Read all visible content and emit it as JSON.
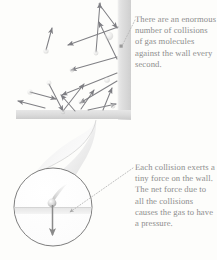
{
  "figure": {
    "background_color": "#fdfdfb",
    "text_color": "#8c8c8c",
    "wall_color": "#d8d8d8",
    "arrow_color": "#808085",
    "circle_outline_color": "#6f6f6f"
  },
  "captions": {
    "top": {
      "text": "There are an enormous number of collisions of gas molecules against the wall every second.",
      "lines": [
        "There are an",
        "enormous number",
        "of collisions of",
        "gas molecules",
        "against the wall",
        "every second."
      ]
    },
    "bottom": {
      "text": "Each collision exerts a tiny force on the wall. The net force due to all the collisions causes the gas to have a pressure.",
      "lines": [
        "Each collision",
        "exerts a tiny force",
        "on the wall. The",
        "net force due to",
        "all the collisions",
        "causes the gas to",
        "have a pressure."
      ]
    }
  },
  "elements": {
    "vertical_wall": "vertical container wall on the right side",
    "horizontal_wall": "horizontal container floor along the bottom",
    "magnifier_cone": "funnel shape linking the wall corner to the magnified view",
    "magnifier_circle": "circular magnified inset of one collision",
    "molecule": "single gas molecule with motion blur striking the wall",
    "force_arrow": "downward force arrow from the collision point",
    "leader_top": "dotted leader from top caption to the wall",
    "leader_bottom": "dotted leader from bottom caption to the magnified circle",
    "molecule_count": 16
  },
  "molecule_trajectories": [
    {
      "x1": 96,
      "y1": 52,
      "x2": 100,
      "y2": 3
    },
    {
      "x1": 99,
      "y1": 3,
      "x2": 118,
      "y2": 27
    },
    {
      "x1": 118,
      "y1": 27,
      "x2": 68,
      "y2": 45
    },
    {
      "x1": 46,
      "y1": 50,
      "x2": 52,
      "y2": 28
    },
    {
      "x1": 118,
      "y1": 57,
      "x2": 71,
      "y2": 70
    },
    {
      "x1": 118,
      "y1": 58,
      "x2": 98,
      "y2": 21
    },
    {
      "x1": 118,
      "y1": 73,
      "x2": 62,
      "y2": 95
    },
    {
      "x1": 118,
      "y1": 80,
      "x2": 80,
      "y2": 103
    },
    {
      "x1": 30,
      "y1": 92,
      "x2": 56,
      "y2": 99
    },
    {
      "x1": 49,
      "y1": 84,
      "x2": 63,
      "y2": 112
    },
    {
      "x1": 63,
      "y1": 112,
      "x2": 84,
      "y2": 84
    },
    {
      "x1": 45,
      "y1": 108,
      "x2": 18,
      "y2": 101
    },
    {
      "x1": 75,
      "y1": 112,
      "x2": 61,
      "y2": 95
    },
    {
      "x1": 81,
      "y1": 109,
      "x2": 94,
      "y2": 90
    },
    {
      "x1": 103,
      "y1": 110,
      "x2": 112,
      "y2": 88
    },
    {
      "x1": 88,
      "y1": 111,
      "x2": 116,
      "y2": 104
    }
  ]
}
